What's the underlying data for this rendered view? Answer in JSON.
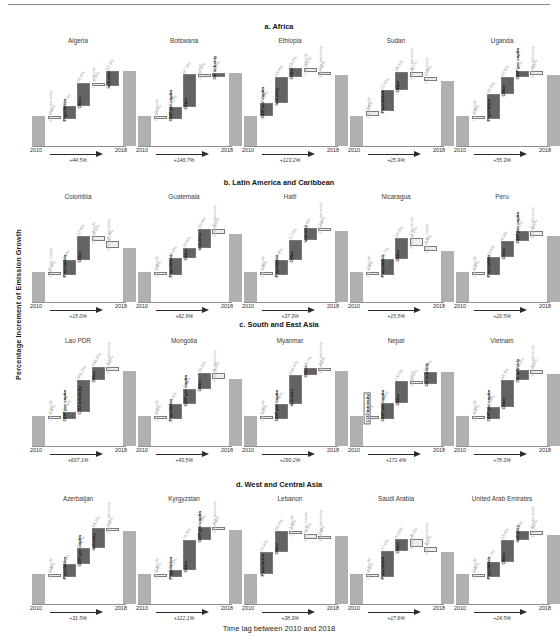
{
  "figure": {
    "ylabel": "Percentage Increment of Emission Growth",
    "xlabel": "Time lag between 2010 and 2018",
    "year_start": "2010",
    "year_end": "2018"
  },
  "colors": {
    "endpoint_bar": "#b0b0b0",
    "positive_strong": "#636363",
    "positive_dark": "#3a3a3a",
    "neutral_white": "#ffffff",
    "negative_light": "#ededed",
    "axis": "#8f8f8f",
    "muted_text": "#b9b9b9"
  },
  "chart_data": {
    "type": "bar",
    "subtype": "waterfall-grid",
    "xlabel": "Time lag between 2010 and 2018",
    "ylabel": "Percentage Increment of Emission Growth",
    "grid": false,
    "legend": "none",
    "sections": [
      {
        "id": "a",
        "label": "a. Africa",
        "panels": [
          {
            "country": "Algeria",
            "growth": "+44.5%",
            "steps": [
              {
                "name": "Energy intensity",
                "pct": "-0.4%",
                "kind": "out"
              },
              {
                "name": "Population",
                "pct": "10.7%",
                "kind": "in"
              },
              {
                "name": "Other",
                "pct": "19.4%",
                "kind": "in"
              },
              {
                "name": "Oil subsidy",
                "pct": "-0.2%",
                "kind": "out"
              },
              {
                "name": "Industry",
                "pct": "12.4%",
                "kind": "in"
              }
            ]
          },
          {
            "country": "Botswana",
            "growth": "+146.7%",
            "steps": [
              {
                "name": "Oil intensity",
                "pct": "-0.7%",
                "kind": "out"
              },
              {
                "name": "GDP per capita",
                "pct": "34.1%",
                "kind": "in"
              },
              {
                "name": "Other",
                "pct": "87.3%",
                "kind": "in"
              },
              {
                "name": "Industry",
                "pct": "-7.5%",
                "kind": "out"
              },
              {
                "name": "Oil subsidy",
                "pct": "10.2%",
                "kind": "in"
              }
            ]
          },
          {
            "country": "Ethiopia",
            "growth": "+123.2%",
            "steps": [
              {
                "name": "GDP per capita",
                "pct": "27.6%",
                "kind": "in"
              },
              {
                "name": "Industry",
                "pct": "53.4%",
                "kind": "in"
              },
              {
                "name": "Other",
                "pct": "18.2%",
                "kind": "in"
              },
              {
                "name": "Oil subsidy",
                "pct": "-5.1%",
                "kind": "out"
              },
              {
                "name": "Energy intensity",
                "pct": "-4.1%",
                "kind": "out"
              }
            ]
          },
          {
            "country": "Sudan",
            "growth": "+25.9%",
            "steps": [
              {
                "name": "Oil subsidy",
                "pct": "5.4%",
                "kind": "out"
              },
              {
                "name": "Population",
                "pct": "21.4%",
                "kind": "in"
              },
              {
                "name": "Other",
                "pct": "18.1%",
                "kind": "in"
              },
              {
                "name": "Energy intensity",
                "pct": "-5.7%",
                "kind": "out"
              },
              {
                "name": "CO2 intensity",
                "pct": "-2.3%",
                "kind": "out"
              }
            ]
          },
          {
            "country": "Uganda",
            "growth": "+55.3%",
            "steps": [
              {
                "name": "Oil subsidy",
                "pct": "-0.9%",
                "kind": "out"
              },
              {
                "name": "Population",
                "pct": "34.1%",
                "kind": "in"
              },
              {
                "name": "Other",
                "pct": "22.6%",
                "kind": "in"
              },
              {
                "name": "GDP per capita",
                "pct": "7.7%",
                "kind": "in"
              },
              {
                "name": "Energy intensity",
                "pct": "-4.6%",
                "kind": "out"
              }
            ]
          }
        ]
      },
      {
        "id": "b",
        "label": "b. Latin America and Caribbean",
        "panels": [
          {
            "country": "Colombia",
            "growth": "+15.0%",
            "steps": [
              {
                "name": "GDP per capita",
                "pct": "-0.3%",
                "kind": "out"
              },
              {
                "name": "Population",
                "pct": "8.4%",
                "kind": "in"
              },
              {
                "name": "Other",
                "pct": "12.8%",
                "kind": "in"
              },
              {
                "name": "Oil subsidy",
                "pct": "-2.5%",
                "kind": "out"
              },
              {
                "name": "Energy intensity",
                "pct": "-4.2%",
                "kind": "out"
              }
            ]
          },
          {
            "country": "Guatemala",
            "growth": "+62.9%",
            "steps": [
              {
                "name": "Oil subsidy",
                "pct": "-0.8%",
                "kind": "out"
              },
              {
                "name": "Population",
                "pct": "18.0%",
                "kind": "in"
              },
              {
                "name": "Other",
                "pct": "10.6%",
                "kind": "in"
              },
              {
                "name": "Industry",
                "pct": "19.4%",
                "kind": "in"
              },
              {
                "name": "Energy intensity",
                "pct": "-5.1%",
                "kind": "out"
              }
            ]
          },
          {
            "country": "Haiti",
            "growth": "+37.3%",
            "steps": [
              {
                "name": "Oil subsidy",
                "pct": "-1.8%",
                "kind": "out"
              },
              {
                "name": "Population",
                "pct": "12.8%",
                "kind": "in"
              },
              {
                "name": "Other",
                "pct": "17.0%",
                "kind": "in"
              },
              {
                "name": "Industry",
                "pct": "9.8%",
                "kind": "in"
              },
              {
                "name": "Energy intensity",
                "pct": "-2.4%",
                "kind": "out"
              }
            ]
          },
          {
            "country": "Nicaragua",
            "growth": "+15.5%",
            "steps": [
              {
                "name": "Oil subsidy",
                "pct": "-1.4%",
                "kind": "out"
              },
              {
                "name": "Population",
                "pct": "11.7%",
                "kind": "in"
              },
              {
                "name": "Other",
                "pct": "14.3%",
                "kind": "in"
              },
              {
                "name": "Energy intensity",
                "pct": "-5.2%",
                "kind": "out"
              },
              {
                "name": "GDP per capita",
                "pct": "-3.9%",
                "kind": "out"
              }
            ]
          },
          {
            "country": "Peru",
            "growth": "+20.5%",
            "steps": [
              {
                "name": "Oil subsidy",
                "pct": "-1.2%",
                "kind": "out"
              },
              {
                "name": "Population",
                "pct": "10.4%",
                "kind": "in"
              },
              {
                "name": "Other",
                "pct": "8.9%",
                "kind": "in"
              },
              {
                "name": "GDP per capita",
                "pct": "5.5%",
                "kind": "in"
              },
              {
                "name": "Energy intensity",
                "pct": "-3.1%",
                "kind": "out"
              }
            ]
          }
        ]
      },
      {
        "id": "c",
        "label": "c. South and East Asia",
        "panels": [
          {
            "country": "Lao PDR",
            "growth": "+637.1%",
            "steps": [
              {
                "name": "Oil subsidy",
                "pct": "-1.1%",
                "kind": "out"
              },
              {
                "name": "GDP per capita",
                "pct": "84.6%",
                "kind": "in"
              },
              {
                "name": "CO2 intensity",
                "pct": "396.2%",
                "kind": "in"
              },
              {
                "name": "Other",
                "pct": "158.4%",
                "kind": "in"
              },
              {
                "name": "Energy intensity",
                "pct": "-1.0%",
                "kind": "out"
              }
            ]
          },
          {
            "country": "Mongolia",
            "growth": "+43.5%",
            "steps": [
              {
                "name": "Oil subsidy",
                "pct": "-0.6%",
                "kind": "out"
              },
              {
                "name": "Population",
                "pct": "16.4%",
                "kind": "in"
              },
              {
                "name": "GDP per capita",
                "pct": "16.5%",
                "kind": "in"
              },
              {
                "name": "Other",
                "pct": "16.6%",
                "kind": "in"
              },
              {
                "name": "Energy intensity",
                "pct": "-6.0%",
                "kind": "out"
              }
            ]
          },
          {
            "country": "Myanmar",
            "growth": "+290.2%",
            "steps": [
              {
                "name": "Oil subsidy",
                "pct": "-1.3%",
                "kind": "out"
              },
              {
                "name": "GDP per capita",
                "pct": "89.5%",
                "kind": "in"
              },
              {
                "name": "Industry",
                "pct": "166.4%",
                "kind": "in"
              },
              {
                "name": "Other",
                "pct": "38.7%",
                "kind": "in"
              },
              {
                "name": "Energy intensity",
                "pct": "-3.1%",
                "kind": "out"
              }
            ]
          },
          {
            "country": "Nepal",
            "growth": "+171.4%",
            "steps": [
              {
                "name": "CO2 intensity",
                "pct": "-1.6%",
                "kind": "box"
              },
              {
                "name": "GDP per capita",
                "pct": "56.5%",
                "kind": "in"
              },
              {
                "name": "Other",
                "pct": "73.0%",
                "kind": "in"
              },
              {
                "name": "Industry",
                "pct": "-3.0%",
                "kind": "out"
              },
              {
                "name": "Oil subsidy",
                "pct": "42.3%",
                "kind": "in"
              }
            ]
          },
          {
            "country": "Vietnam",
            "growth": "+78.3%",
            "steps": [
              {
                "name": "Oil subsidy",
                "pct": "-1.4%",
                "kind": "out"
              },
              {
                "name": "GDP per capita",
                "pct": "21.4%",
                "kind": "in"
              },
              {
                "name": "Other",
                "pct": "48.3%",
                "kind": "in"
              },
              {
                "name": "Oil subsidy",
                "pct": "16.2%",
                "kind": "in"
              },
              {
                "name": "Energy intensity",
                "pct": "-4.3%",
                "kind": "out"
              }
            ]
          }
        ]
      },
      {
        "id": "d",
        "label": "d. West and Central Asia",
        "panels": [
          {
            "country": "Azerbaijan",
            "growth": "+31.5%",
            "steps": [
              {
                "name": "Oil subsidy",
                "pct": "-0.8%",
                "kind": "out"
              },
              {
                "name": "Population",
                "pct": "9.5%",
                "kind": "in"
              },
              {
                "name": "GDP per capita",
                "pct": "10.7%",
                "kind": "in"
              },
              {
                "name": "Industry",
                "pct": "14.2%",
                "kind": "in"
              },
              {
                "name": "Energy intensity",
                "pct": "-1.2%",
                "kind": "out"
              }
            ]
          },
          {
            "country": "Kyrgyzstan",
            "growth": "+122.1%",
            "steps": [
              {
                "name": "Oil subsidy",
                "pct": "-1.5%",
                "kind": "out"
              },
              {
                "name": "Population",
                "pct": "19.2%",
                "kind": "in"
              },
              {
                "name": "Other",
                "pct": "76.3%",
                "kind": "in"
              },
              {
                "name": "GDP per capita",
                "pct": "31.4%",
                "kind": "in"
              },
              {
                "name": "Energy intensity",
                "pct": "-3.4%",
                "kind": "out"
              }
            ]
          },
          {
            "country": "Lebanon",
            "growth": "+38.3%",
            "steps": [
              {
                "name": "Population",
                "pct": "21.4%",
                "kind": "in"
              },
              {
                "name": "Other",
                "pct": "20.0%",
                "kind": "in"
              },
              {
                "name": "Oil subsidy",
                "pct": "-1.4%",
                "kind": "out"
              },
              {
                "name": "GDP per capita",
                "pct": "-4.5%",
                "kind": "out"
              },
              {
                "name": "Energy intensity",
                "pct": "2.8%",
                "kind": "out"
              }
            ]
          },
          {
            "country": "Saudi Arabia",
            "growth": "+17.6%",
            "steps": [
              {
                "name": "Oil subsidy",
                "pct": "-1.6%",
                "kind": "out"
              },
              {
                "name": "Population",
                "pct": "27.0%",
                "kind": "in"
              },
              {
                "name": "Other",
                "pct": "12.6%",
                "kind": "in"
              },
              {
                "name": "Industry",
                "pct": "-8.2%",
                "kind": "out"
              },
              {
                "name": "Energy intensity",
                "pct": "-5.1%",
                "kind": "out"
              }
            ]
          },
          {
            "country": "United Arab Emirates",
            "growth": "+24.5%",
            "steps": [
              {
                "name": "Oil subsidy",
                "pct": "-0.6%",
                "kind": "out"
              },
              {
                "name": "Population",
                "pct": "10.7%",
                "kind": "in"
              },
              {
                "name": "Other",
                "pct": "15.4%",
                "kind": "in"
              },
              {
                "name": "Industry",
                "pct": "6.4%",
                "kind": "in"
              },
              {
                "name": "Energy intensity",
                "pct": "-3.2%",
                "kind": "out"
              }
            ]
          }
        ]
      }
    ]
  }
}
